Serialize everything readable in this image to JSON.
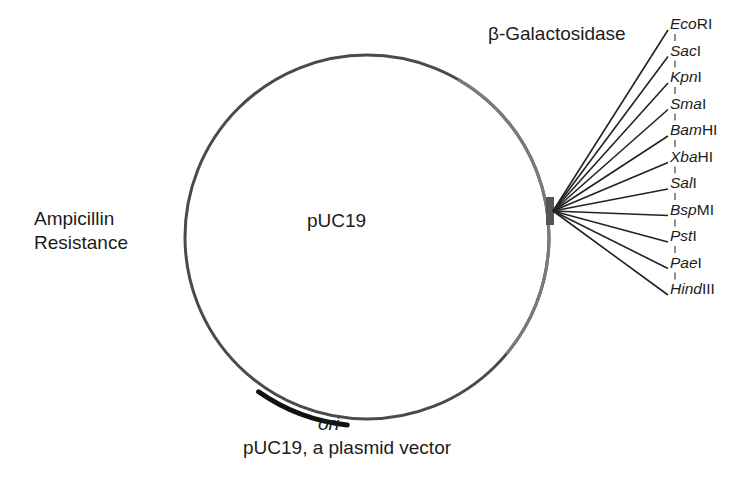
{
  "diagram": {
    "title": "pUC19, a plasmid vector",
    "plasmid_name": "pUC19",
    "features": {
      "lacZ": "β-Galactosidase",
      "amp_line1": "Ampicillin",
      "amp_line2": "Resistance",
      "ori": "ori"
    },
    "mcs_label": "Multiple cloning site",
    "restriction_sites": [
      {
        "italic": "Eco",
        "roman": "RI"
      },
      {
        "italic": "Sac",
        "roman": "I"
      },
      {
        "italic": "Kpn",
        "roman": "I"
      },
      {
        "italic": "Sma",
        "roman": "I"
      },
      {
        "italic": "Bam",
        "roman": "HI"
      },
      {
        "italic": "Xba",
        "roman": "HI"
      },
      {
        "italic": "Sal",
        "roman": "I"
      },
      {
        "italic": "Bsp",
        "roman": "MI"
      },
      {
        "italic": "Pst",
        "roman": "I"
      },
      {
        "italic": "Pae",
        "roman": "I"
      },
      {
        "italic": "Hind",
        "roman": "III"
      }
    ],
    "colors": {
      "backbone": "#4a4a4a",
      "lacZ_segment": "#7a7a7a",
      "ori_bar": "#111111",
      "mcs_block": "#555555",
      "leader_lines": "#222222"
    }
  }
}
